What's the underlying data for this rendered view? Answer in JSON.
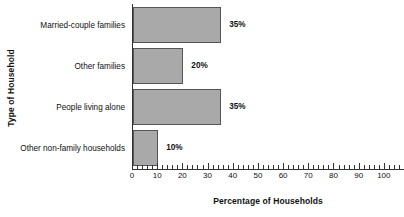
{
  "chart_data": {
    "type": "bar",
    "orientation": "horizontal",
    "title": "",
    "xlabel": "Percentage of Households",
    "ylabel": "Type of Household",
    "categories": [
      "Married-couple families",
      "Other families",
      "People living alone",
      "Other non-family households"
    ],
    "values": [
      35,
      20,
      35,
      10
    ],
    "data_labels": [
      "35%",
      "20%",
      "35%",
      "10%"
    ],
    "xlim": [
      0,
      100
    ],
    "ylim": [
      0,
      4
    ],
    "x_major_ticks": [
      0,
      10,
      20,
      30,
      40,
      50,
      60,
      70,
      80,
      90,
      100
    ],
    "x_tick_labels": [
      "0",
      "10",
      "20",
      "30",
      "40",
      "50",
      "60",
      "70",
      "80",
      "90",
      "100"
    ],
    "x_minor_tick_interval": 2,
    "grid": false,
    "legend": false,
    "bar_color": "#a9a9a9",
    "bar_border_color": "#555555",
    "axis_color": "#333333",
    "background_color": "#ffffff"
  }
}
